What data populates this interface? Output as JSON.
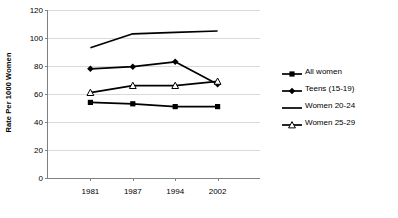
{
  "chart_data": {
    "type": "line",
    "title": "",
    "xlabel": "",
    "ylabel": "Rate Per 1000 Women",
    "categories": [
      "1981",
      "1987",
      "1994",
      "2002"
    ],
    "x_tick_labels": [
      "1981",
      "1987",
      "1994",
      "2002"
    ],
    "y_tick_labels": [
      "0",
      "20",
      "40",
      "60",
      "80",
      "100",
      "120"
    ],
    "y_ticks": [
      0,
      20,
      40,
      60,
      80,
      100,
      120
    ],
    "ylim": [
      0,
      120
    ],
    "grid": "horizontal",
    "legend_position": "right",
    "series": [
      {
        "name": "All women",
        "marker": "filled-square",
        "color": "#000000",
        "values": [
          54,
          53,
          51,
          51
        ]
      },
      {
        "name": "Teens (15-19)",
        "marker": "filled-diamond",
        "color": "#000000",
        "values": [
          78,
          79.5,
          83,
          67
        ]
      },
      {
        "name": "Women 20-24",
        "marker": "none",
        "color": "#000000",
        "values": [
          93,
          103,
          104,
          105
        ]
      },
      {
        "name": "Women 25-29",
        "marker": "open-triangle",
        "color": "#000000",
        "values": [
          61,
          66,
          66,
          69
        ]
      }
    ]
  },
  "legend": {
    "items": [
      {
        "label": "All women",
        "key": "filled-square-line-key"
      },
      {
        "label": "Teens (15-19)",
        "key": "filled-diamond-line-key"
      },
      {
        "label": "Women 20-24",
        "key": "plain-line-key"
      },
      {
        "label": "Women 25-29",
        "key": "open-triangle-line-key"
      }
    ]
  },
  "axes": {
    "y_title": "Rate Per 1000 Women"
  }
}
